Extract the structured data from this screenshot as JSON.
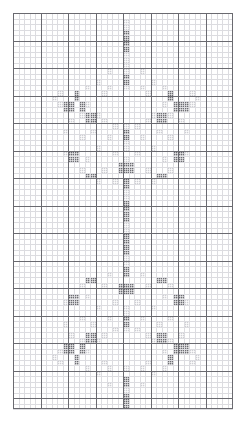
{
  "chart_data": {
    "type": "heatmap",
    "title": "",
    "xlabel": "",
    "ylabel": "",
    "grid": true,
    "legend": "none",
    "columns": 40,
    "rows": 72,
    "cell_size_px": 5.5,
    "major_every": 5,
    "colors": {
      "background": "#ffffff",
      "minor_line": "#dcdce0",
      "major_line": "#6a6a70",
      "symbol_dark": "#6e6e74",
      "symbol_light": "#cfcfd4"
    },
    "symbols": [
      {
        "key": "dark",
        "label": "full stitch",
        "color": "#6e6e74"
      },
      {
        "key": "light",
        "label": "half stitch",
        "color": "#cfcfd4"
      }
    ],
    "dark_cells": [
      [
        20,
        3
      ],
      [
        20,
        4
      ],
      [
        20,
        5
      ],
      [
        20,
        6
      ],
      [
        20,
        11
      ],
      [
        20,
        12
      ],
      [
        11,
        14
      ],
      [
        11,
        15
      ],
      [
        28,
        14
      ],
      [
        28,
        15
      ],
      [
        9,
        16
      ],
      [
        10,
        16
      ],
      [
        12,
        16
      ],
      [
        29,
        16
      ],
      [
        30,
        16
      ],
      [
        31,
        16
      ],
      [
        9,
        17
      ],
      [
        10,
        17
      ],
      [
        12,
        17
      ],
      [
        29,
        17
      ],
      [
        30,
        17
      ],
      [
        31,
        17
      ],
      [
        13,
        18
      ],
      [
        14,
        18
      ],
      [
        26,
        18
      ],
      [
        27,
        18
      ],
      [
        13,
        19
      ],
      [
        14,
        19
      ],
      [
        26,
        19
      ],
      [
        27,
        19
      ],
      [
        20,
        21
      ],
      [
        20,
        22
      ],
      [
        10,
        25
      ],
      [
        11,
        25
      ],
      [
        29,
        25
      ],
      [
        30,
        25
      ],
      [
        10,
        26
      ],
      [
        11,
        26
      ],
      [
        29,
        26
      ],
      [
        30,
        26
      ],
      [
        19,
        27
      ],
      [
        20,
        27
      ],
      [
        21,
        27
      ],
      [
        19,
        28
      ],
      [
        20,
        28
      ],
      [
        21,
        28
      ],
      [
        13,
        29
      ],
      [
        14,
        29
      ],
      [
        26,
        29
      ],
      [
        27,
        29
      ],
      [
        20,
        30
      ],
      [
        20,
        31
      ],
      [
        20,
        34
      ],
      [
        20,
        35
      ],
      [
        20,
        36
      ],
      [
        20,
        37
      ],
      [
        20,
        40
      ],
      [
        20,
        41
      ],
      [
        20,
        42
      ],
      [
        20,
        43
      ],
      [
        20,
        46
      ],
      [
        20,
        47
      ],
      [
        13,
        48
      ],
      [
        14,
        48
      ],
      [
        26,
        48
      ],
      [
        27,
        48
      ],
      [
        19,
        49
      ],
      [
        20,
        49
      ],
      [
        21,
        49
      ],
      [
        19,
        50
      ],
      [
        20,
        50
      ],
      [
        21,
        50
      ],
      [
        10,
        51
      ],
      [
        11,
        51
      ],
      [
        29,
        51
      ],
      [
        30,
        51
      ],
      [
        10,
        52
      ],
      [
        11,
        52
      ],
      [
        29,
        52
      ],
      [
        30,
        52
      ],
      [
        20,
        55
      ],
      [
        20,
        56
      ],
      [
        13,
        58
      ],
      [
        14,
        58
      ],
      [
        26,
        58
      ],
      [
        27,
        58
      ],
      [
        13,
        59
      ],
      [
        14,
        59
      ],
      [
        26,
        59
      ],
      [
        27,
        59
      ],
      [
        9,
        60
      ],
      [
        10,
        60
      ],
      [
        12,
        60
      ],
      [
        29,
        60
      ],
      [
        30,
        60
      ],
      [
        31,
        60
      ],
      [
        9,
        61
      ],
      [
        10,
        61
      ],
      [
        12,
        61
      ],
      [
        29,
        61
      ],
      [
        30,
        61
      ],
      [
        31,
        61
      ],
      [
        11,
        62
      ],
      [
        11,
        63
      ],
      [
        28,
        62
      ],
      [
        28,
        63
      ],
      [
        20,
        66
      ],
      [
        20,
        67
      ],
      [
        20,
        69
      ],
      [
        20,
        70
      ],
      [
        20,
        71
      ]
    ],
    "light_cells": [
      [
        20,
        1
      ],
      [
        20,
        2
      ],
      [
        20,
        7
      ],
      [
        20,
        8
      ],
      [
        20,
        9
      ],
      [
        20,
        10
      ],
      [
        17,
        10
      ],
      [
        23,
        10
      ],
      [
        15,
        12
      ],
      [
        25,
        12
      ],
      [
        13,
        13
      ],
      [
        17,
        13
      ],
      [
        20,
        13
      ],
      [
        23,
        13
      ],
      [
        27,
        13
      ],
      [
        8,
        14
      ],
      [
        16,
        14
      ],
      [
        24,
        14
      ],
      [
        32,
        14
      ],
      [
        7,
        15
      ],
      [
        33,
        15
      ],
      [
        8,
        16
      ],
      [
        13,
        16
      ],
      [
        27,
        16
      ],
      [
        32,
        16
      ],
      [
        12,
        18
      ],
      [
        15,
        18
      ],
      [
        25,
        18
      ],
      [
        28,
        18
      ],
      [
        10,
        19
      ],
      [
        16,
        19
      ],
      [
        24,
        19
      ],
      [
        30,
        19
      ],
      [
        18,
        20
      ],
      [
        22,
        20
      ],
      [
        20,
        20
      ],
      [
        9,
        21
      ],
      [
        14,
        21
      ],
      [
        26,
        21
      ],
      [
        31,
        21
      ],
      [
        12,
        22
      ],
      [
        17,
        22
      ],
      [
        23,
        22
      ],
      [
        28,
        22
      ],
      [
        20,
        23
      ],
      [
        20,
        24
      ],
      [
        15,
        24
      ],
      [
        25,
        24
      ],
      [
        9,
        25
      ],
      [
        18,
        25
      ],
      [
        22,
        25
      ],
      [
        31,
        25
      ],
      [
        13,
        26
      ],
      [
        27,
        26
      ],
      [
        20,
        26
      ],
      [
        12,
        28
      ],
      [
        16,
        28
      ],
      [
        24,
        28
      ],
      [
        28,
        28
      ],
      [
        15,
        30
      ],
      [
        25,
        30
      ],
      [
        18,
        30
      ],
      [
        22,
        30
      ],
      [
        20,
        32
      ],
      [
        20,
        33
      ],
      [
        20,
        38
      ],
      [
        20,
        39
      ],
      [
        20,
        44
      ],
      [
        20,
        45
      ],
      [
        17,
        47
      ],
      [
        23,
        47
      ],
      [
        12,
        49
      ],
      [
        16,
        49
      ],
      [
        24,
        49
      ],
      [
        28,
        49
      ],
      [
        13,
        51
      ],
      [
        27,
        51
      ],
      [
        9,
        52
      ],
      [
        18,
        52
      ],
      [
        22,
        52
      ],
      [
        31,
        52
      ],
      [
        15,
        53
      ],
      [
        25,
        53
      ],
      [
        20,
        53
      ],
      [
        20,
        54
      ],
      [
        12,
        55
      ],
      [
        17,
        55
      ],
      [
        23,
        55
      ],
      [
        28,
        55
      ],
      [
        9,
        56
      ],
      [
        14,
        56
      ],
      [
        26,
        56
      ],
      [
        31,
        56
      ],
      [
        18,
        57
      ],
      [
        20,
        57
      ],
      [
        22,
        57
      ],
      [
        10,
        58
      ],
      [
        16,
        58
      ],
      [
        24,
        58
      ],
      [
        30,
        58
      ],
      [
        12,
        59
      ],
      [
        15,
        59
      ],
      [
        25,
        59
      ],
      [
        28,
        59
      ],
      [
        8,
        61
      ],
      [
        13,
        61
      ],
      [
        27,
        61
      ],
      [
        32,
        61
      ],
      [
        7,
        62
      ],
      [
        33,
        62
      ],
      [
        8,
        63
      ],
      [
        16,
        63
      ],
      [
        24,
        63
      ],
      [
        32,
        63
      ],
      [
        13,
        64
      ],
      [
        17,
        64
      ],
      [
        20,
        64
      ],
      [
        23,
        64
      ],
      [
        27,
        64
      ],
      [
        15,
        65
      ],
      [
        25,
        65
      ],
      [
        17,
        67
      ],
      [
        23,
        67
      ],
      [
        20,
        68
      ]
    ]
  },
  "meta": {
    "frame_name": "pattern-grid"
  }
}
